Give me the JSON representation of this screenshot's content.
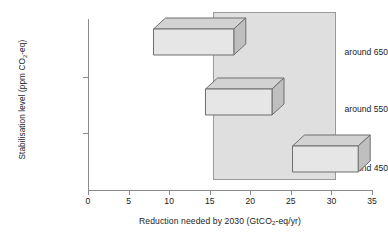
{
  "chart_data": {
    "type": "bar",
    "orientation": "horizontal",
    "title": "",
    "subtitle": "",
    "xlabel": "Reduction needed by 2030 (GtCO2-eq/yr)",
    "ylabel": "Stabilisation level (ppm CO2-eq)",
    "categories": [
      "around 650",
      "around 550",
      "around 450"
    ],
    "series": [
      {
        "name": "Reduction range",
        "ranges": [
          {
            "category": "around 650",
            "low": 8.0,
            "high": 17.9
          },
          {
            "category": "around 550",
            "low": 14.4,
            "high": 22.6
          },
          {
            "category": "around 450",
            "low": 25.1,
            "high": 33.2
          }
        ]
      }
    ],
    "annotations": [
      {
        "name": "shaded-range-band",
        "type": "vertical-band",
        "x_low": 15.4,
        "x_high": 30.6,
        "color": "#969696"
      }
    ],
    "xlim": [
      0,
      35
    ],
    "xticks": [
      0,
      5,
      10,
      15,
      20,
      25,
      30,
      35
    ],
    "xticklabels": [
      "0",
      "5",
      "10",
      "15",
      "20",
      "25",
      "30",
      "35"
    ],
    "grid": false,
    "legend": null,
    "bar_style": "3d-isometric",
    "colors": {
      "bar_front": "#e6e6e6",
      "bar_top": "#d2d2d2",
      "bar_side": "#bfbfbf",
      "bar_edge": "#6e6e6e",
      "band_fill": "#969696",
      "band_edge": "#9a9a9a",
      "axis": "#8a8a8a",
      "text": "#1c1c1c",
      "background": "#ffffff"
    }
  },
  "axes": {
    "y_title_prefix": "Stabilisation level (ppm CO",
    "y_title_sub": "2",
    "y_title_suffix": "-eq)",
    "x_title_prefix": "Reduction needed by 2030 (GtCO",
    "x_title_sub": "2",
    "x_title_suffix": "-eq/yr)"
  },
  "ticks": {
    "x": [
      "0",
      "5",
      "10",
      "15",
      "20",
      "25",
      "30",
      "35"
    ],
    "y": [
      "around 650",
      "around 550",
      "around 450"
    ]
  }
}
